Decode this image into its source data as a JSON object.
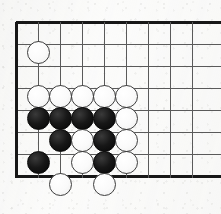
{
  "board": {
    "title": "Go board corner position",
    "board_style": "go-goban",
    "origin_x": 16,
    "origin_y": 22,
    "cell_size": 22,
    "stone_radius": 11.5,
    "columns": 9,
    "rows": 8,
    "line_color": "#5a5a5a",
    "edge_color": "#171717",
    "background_color": "#fbfbfa",
    "white_stone_color": "#fafafa",
    "black_stone_color": "#171717",
    "edges": {
      "left": true,
      "top": true,
      "bottom": true,
      "right": false
    },
    "grid_x": [
      16,
      38,
      60,
      82,
      104,
      126,
      148,
      170,
      192
    ],
    "grid_y": [
      22,
      44,
      66,
      88,
      110,
      132,
      154,
      176
    ],
    "stones": [
      {
        "color": "white",
        "col": 1,
        "row": 1,
        "x": 38,
        "y": 52,
        "label": "white-stone-b2"
      },
      {
        "color": "white",
        "col": 1,
        "row": 3,
        "x": 38,
        "y": 96,
        "label": "white-stone-b4"
      },
      {
        "color": "white",
        "col": 2,
        "row": 3,
        "x": 60,
        "y": 96,
        "label": "white-stone-c4"
      },
      {
        "color": "white",
        "col": 3,
        "row": 3,
        "x": 82,
        "y": 96,
        "label": "white-stone-d4"
      },
      {
        "color": "white",
        "col": 4,
        "row": 3,
        "x": 104,
        "y": 96,
        "label": "white-stone-e4"
      },
      {
        "color": "white",
        "col": 5,
        "row": 3,
        "x": 126,
        "y": 96,
        "label": "white-stone-f4"
      },
      {
        "color": "black",
        "col": 1,
        "row": 4,
        "x": 38,
        "y": 118,
        "label": "black-stone-b5"
      },
      {
        "color": "black",
        "col": 2,
        "row": 4,
        "x": 60,
        "y": 118,
        "label": "black-stone-c5"
      },
      {
        "color": "black",
        "col": 3,
        "row": 4,
        "x": 82,
        "y": 118,
        "label": "black-stone-d5"
      },
      {
        "color": "black",
        "col": 4,
        "row": 4,
        "x": 104,
        "y": 118,
        "label": "black-stone-e5"
      },
      {
        "color": "white",
        "col": 5,
        "row": 4,
        "x": 126,
        "y": 118,
        "label": "white-stone-f5"
      },
      {
        "color": "black",
        "col": 2,
        "row": 5,
        "x": 60,
        "y": 140,
        "label": "black-stone-c6"
      },
      {
        "color": "white",
        "col": 3,
        "row": 5,
        "x": 82,
        "y": 140,
        "label": "white-stone-d6"
      },
      {
        "color": "black",
        "col": 4,
        "row": 5,
        "x": 104,
        "y": 140,
        "label": "black-stone-e6"
      },
      {
        "color": "white",
        "col": 5,
        "row": 5,
        "x": 126,
        "y": 140,
        "label": "white-stone-f6"
      },
      {
        "color": "black",
        "col": 1,
        "row": 6,
        "x": 38,
        "y": 162,
        "label": "black-stone-b7"
      },
      {
        "color": "white",
        "col": 3,
        "row": 6,
        "x": 82,
        "y": 162,
        "label": "white-stone-d7"
      },
      {
        "color": "black",
        "col": 4,
        "row": 6,
        "x": 104,
        "y": 162,
        "label": "black-stone-e7"
      },
      {
        "color": "white",
        "col": 5,
        "row": 6,
        "x": 126,
        "y": 162,
        "label": "white-stone-f7"
      },
      {
        "color": "white",
        "col": 2,
        "row": 7,
        "x": 60,
        "y": 184,
        "label": "white-stone-c8"
      },
      {
        "color": "white",
        "col": 4,
        "row": 7,
        "x": 104,
        "y": 184,
        "label": "white-stone-e8"
      }
    ]
  }
}
